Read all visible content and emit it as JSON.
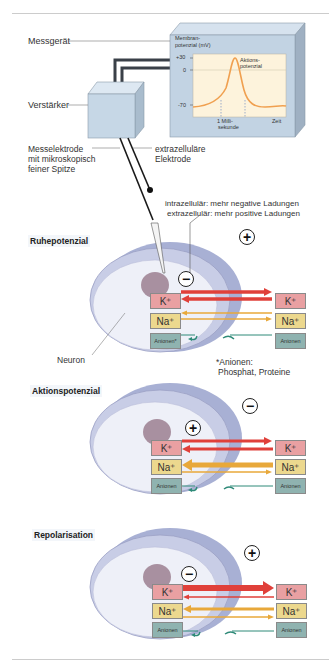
{
  "apparatus": {
    "meter_label": "Messgerät",
    "amplifier_label": "Verstärker",
    "measuring_electrode_label": [
      "Messelektrode",
      "mit mikroskopisch",
      "feiner Spitze"
    ],
    "extracellular_electrode_label": [
      "extrazelluläre",
      "Elektrode"
    ],
    "screen": {
      "y_axis_title": [
        "Membran-",
        "potenzial (mV)"
      ],
      "y_ticks": [
        "+30",
        "0",
        "-70"
      ],
      "x_tick": [
        "1 Milli-",
        "sekunde"
      ],
      "x_axis_title": "Zeit",
      "curve_label": [
        "Aktions-",
        "potenzial"
      ]
    }
  },
  "charge_note": [
    "intrazellulär: mehr negative Ladungen",
    "extrazellulär: mehr positive Ladungen"
  ],
  "neuron_label": "Neuron",
  "anion_footnote": [
    "*Anionen:",
    "Phosphat, Proteine"
  ],
  "ions": {
    "k": "K⁺",
    "na": "Na⁺",
    "anion_star": "Anionen*",
    "anion": "Anionen"
  },
  "signs": {
    "plus": "+",
    "minus": "−"
  },
  "panels": [
    {
      "title": "Ruhepotenzial",
      "inside_sign": "−",
      "outside_sign": "+"
    },
    {
      "title": "Aktionspotenzial",
      "inside_sign": "+",
      "outside_sign": "−"
    },
    {
      "title": "Repolarisation",
      "inside_sign": "−",
      "outside_sign": "+"
    }
  ],
  "colors": {
    "k_arrow": "#e0403a",
    "na_arrow": "#e8a83a",
    "anion_arrow": "#2e8a78",
    "k_box": "#e9a0a2",
    "na_box": "#ecd88e",
    "anion_box": "#8fb3b0",
    "cell": "#c8cde6",
    "screen": "#fdf3dc",
    "curve": "#f0a050"
  }
}
